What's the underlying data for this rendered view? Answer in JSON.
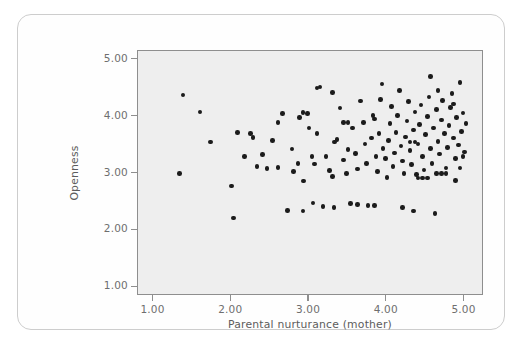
{
  "figure": {
    "background_color": "#ffffff",
    "card_border_color": "#cdcdcd",
    "panel_background": "#eeeeee",
    "panel_border_color": "#8e8e8e",
    "point_color": "#1b1b1b",
    "axis_text_color": "#6e6e6e"
  },
  "axes": {
    "x_title": "Parental nurturance (mother)",
    "y_title": "Openness",
    "x_ticks": [
      "1.00",
      "2.00",
      "3.00",
      "4.00",
      "5.00"
    ],
    "y_ticks": [
      "5.00",
      "4.00",
      "3.00",
      "2.00",
      "1.00"
    ]
  },
  "chart_data": {
    "type": "scatter",
    "title": "",
    "xlabel": "Parental nurturance (mother)",
    "ylabel": "Openness",
    "xlim": [
      0.8,
      5.25
    ],
    "ylim": [
      0.85,
      5.15
    ],
    "x_tick_values": [
      1.0,
      2.0,
      3.0,
      4.0,
      5.0
    ],
    "y_tick_values": [
      1.0,
      2.0,
      3.0,
      4.0,
      5.0
    ],
    "grid": false,
    "legend": null,
    "marker": {
      "shape": "circle",
      "color": "#1b1b1b",
      "size": 4.6
    },
    "n_points": 134,
    "points": [
      [
        1.38,
        4.38
      ],
      [
        1.33,
        3.0
      ],
      [
        1.6,
        4.08
      ],
      [
        1.73,
        3.55
      ],
      [
        2.0,
        2.78
      ],
      [
        2.03,
        2.22
      ],
      [
        2.08,
        3.72
      ],
      [
        2.25,
        3.7
      ],
      [
        2.28,
        3.63
      ],
      [
        2.17,
        3.3
      ],
      [
        2.4,
        3.33
      ],
      [
        2.33,
        3.12
      ],
      [
        2.46,
        3.09
      ],
      [
        2.6,
        3.11
      ],
      [
        2.53,
        3.58
      ],
      [
        2.6,
        3.9
      ],
      [
        2.72,
        2.35
      ],
      [
        2.8,
        3.04
      ],
      [
        2.78,
        3.43
      ],
      [
        2.86,
        3.18
      ],
      [
        2.93,
        2.87
      ],
      [
        2.88,
        3.98
      ],
      [
        2.92,
        4.07
      ],
      [
        2.98,
        4.05
      ],
      [
        3.0,
        3.8
      ],
      [
        3.04,
        3.3
      ],
      [
        3.07,
        3.17
      ],
      [
        3.1,
        3.7
      ],
      [
        3.14,
        4.52
      ],
      [
        3.05,
        2.48
      ],
      [
        3.18,
        2.42
      ],
      [
        3.22,
        3.3
      ],
      [
        3.26,
        3.05
      ],
      [
        3.3,
        2.95
      ],
      [
        3.33,
        3.55
      ],
      [
        3.36,
        3.6
      ],
      [
        3.4,
        4.15
      ],
      [
        3.3,
        4.42
      ],
      [
        3.44,
        3.24
      ],
      [
        3.48,
        3.0
      ],
      [
        3.5,
        3.42
      ],
      [
        3.53,
        2.47
      ],
      [
        3.56,
        3.8
      ],
      [
        3.6,
        3.35
      ],
      [
        3.62,
        3.08
      ],
      [
        3.66,
        4.27
      ],
      [
        3.7,
        3.9
      ],
      [
        3.72,
        3.52
      ],
      [
        3.74,
        3.18
      ],
      [
        3.76,
        2.44
      ],
      [
        3.8,
        3.62
      ],
      [
        3.82,
        4.02
      ],
      [
        3.84,
        3.96
      ],
      [
        3.86,
        3.3
      ],
      [
        3.88,
        3.04
      ],
      [
        3.9,
        3.7
      ],
      [
        3.92,
        4.3
      ],
      [
        3.94,
        4.57
      ],
      [
        3.95,
        3.44
      ],
      [
        3.98,
        3.26
      ],
      [
        4.0,
        2.93
      ],
      [
        4.02,
        3.58
      ],
      [
        4.04,
        3.88
      ],
      [
        4.06,
        4.18
      ],
      [
        4.08,
        3.12
      ],
      [
        4.1,
        3.36
      ],
      [
        4.12,
        3.72
      ],
      [
        4.14,
        4.02
      ],
      [
        4.16,
        4.46
      ],
      [
        4.18,
        3.48
      ],
      [
        4.2,
        3.22
      ],
      [
        4.22,
        3.0
      ],
      [
        4.24,
        3.64
      ],
      [
        4.26,
        3.92
      ],
      [
        4.28,
        4.26
      ],
      [
        4.3,
        3.4
      ],
      [
        4.32,
        3.16
      ],
      [
        4.34,
        3.76
      ],
      [
        4.36,
        4.08
      ],
      [
        4.38,
        2.98
      ],
      [
        4.4,
        3.52
      ],
      [
        4.42,
        3.86
      ],
      [
        4.44,
        4.2
      ],
      [
        4.46,
        3.3
      ],
      [
        4.48,
        3.06
      ],
      [
        4.5,
        3.68
      ],
      [
        4.52,
        4.0
      ],
      [
        4.54,
        4.34
      ],
      [
        4.56,
        3.44
      ],
      [
        4.58,
        3.18
      ],
      [
        4.6,
        3.8
      ],
      [
        4.62,
        2.3
      ],
      [
        4.64,
        4.12
      ],
      [
        4.66,
        3.56
      ],
      [
        4.68,
        3.34
      ],
      [
        4.7,
        3.94
      ],
      [
        4.72,
        4.28
      ],
      [
        4.74,
        3.7
      ],
      [
        4.76,
        3.1
      ],
      [
        4.78,
        3.46
      ],
      [
        4.8,
        3.84
      ],
      [
        4.82,
        4.16
      ],
      [
        4.84,
        4.4
      ],
      [
        4.86,
        3.62
      ],
      [
        4.88,
        3.26
      ],
      [
        4.9,
        3.98
      ],
      [
        4.92,
        3.5
      ],
      [
        4.94,
        4.6
      ],
      [
        4.96,
        3.74
      ],
      [
        4.98,
        4.06
      ],
      [
        5.0,
        3.38
      ],
      [
        5.02,
        3.88
      ],
      [
        4.64,
        3.0
      ],
      [
        4.7,
        3.0
      ],
      [
        4.76,
        3.0
      ],
      [
        4.4,
        2.92
      ],
      [
        4.46,
        2.92
      ],
      [
        4.52,
        2.92
      ],
      [
        4.3,
        3.55
      ],
      [
        4.36,
        3.55
      ],
      [
        3.44,
        3.9
      ],
      [
        3.5,
        3.9
      ],
      [
        4.56,
        4.7
      ],
      [
        4.66,
        4.46
      ],
      [
        4.86,
        4.22
      ],
      [
        4.94,
        3.1
      ],
      [
        4.98,
        3.3
      ],
      [
        4.88,
        2.88
      ],
      [
        3.84,
        2.44
      ],
      [
        3.62,
        2.46
      ],
      [
        3.32,
        2.4
      ],
      [
        2.92,
        2.34
      ],
      [
        4.2,
        2.4
      ],
      [
        4.34,
        2.34
      ],
      [
        3.1,
        4.5
      ],
      [
        2.66,
        4.05
      ]
    ]
  }
}
